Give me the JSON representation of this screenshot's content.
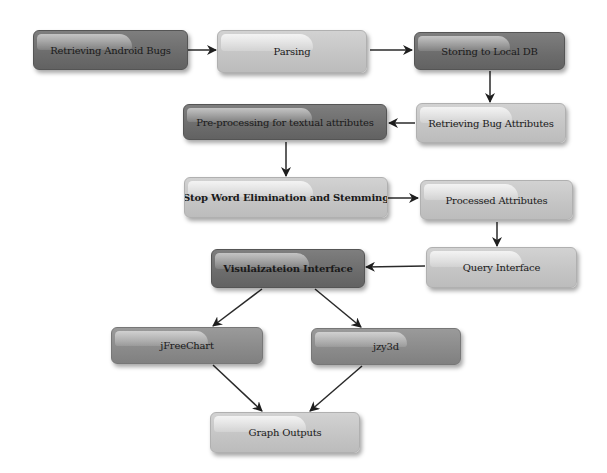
{
  "diagram": {
    "type": "flowchart",
    "nodes": [
      {
        "id": "retrieving-android-bugs",
        "label": "Retrieving Android Bugs",
        "shade": "dark"
      },
      {
        "id": "parsing",
        "label": "Parsing",
        "shade": "light"
      },
      {
        "id": "storing-local-db",
        "label": "Storing to Local DB",
        "shade": "dark"
      },
      {
        "id": "retrieving-bug-attributes",
        "label": "Retrieving Bug Attributes",
        "shade": "light"
      },
      {
        "id": "preprocessing",
        "label": "Pre-processing for textual attributes",
        "shade": "dark"
      },
      {
        "id": "stop-word",
        "label": "Stop Word Elimination and Stemming",
        "shade": "light"
      },
      {
        "id": "processed-attributes",
        "label": "Processed Attributes",
        "shade": "light"
      },
      {
        "id": "query-interface",
        "label": "Query Interface",
        "shade": "light"
      },
      {
        "id": "visualization-interface",
        "label": "Visulaizateion Interface",
        "shade": "dark"
      },
      {
        "id": "jfreechart",
        "label": "jFreeChart",
        "shade": "mid"
      },
      {
        "id": "jzy3d",
        "label": "jzy3d",
        "shade": "mid"
      },
      {
        "id": "graph-outputs",
        "label": "Graph Outputs",
        "shade": "light"
      }
    ],
    "edges": [
      {
        "from": "retrieving-android-bugs",
        "to": "parsing"
      },
      {
        "from": "parsing",
        "to": "storing-local-db"
      },
      {
        "from": "storing-local-db",
        "to": "retrieving-bug-attributes"
      },
      {
        "from": "retrieving-bug-attributes",
        "to": "preprocessing"
      },
      {
        "from": "preprocessing",
        "to": "stop-word"
      },
      {
        "from": "stop-word",
        "to": "processed-attributes"
      },
      {
        "from": "processed-attributes",
        "to": "query-interface"
      },
      {
        "from": "query-interface",
        "to": "visualization-interface"
      },
      {
        "from": "visualization-interface",
        "to": "jfreechart"
      },
      {
        "from": "visualization-interface",
        "to": "jzy3d"
      },
      {
        "from": "jfreechart",
        "to": "graph-outputs"
      },
      {
        "from": "jzy3d",
        "to": "graph-outputs"
      }
    ]
  }
}
